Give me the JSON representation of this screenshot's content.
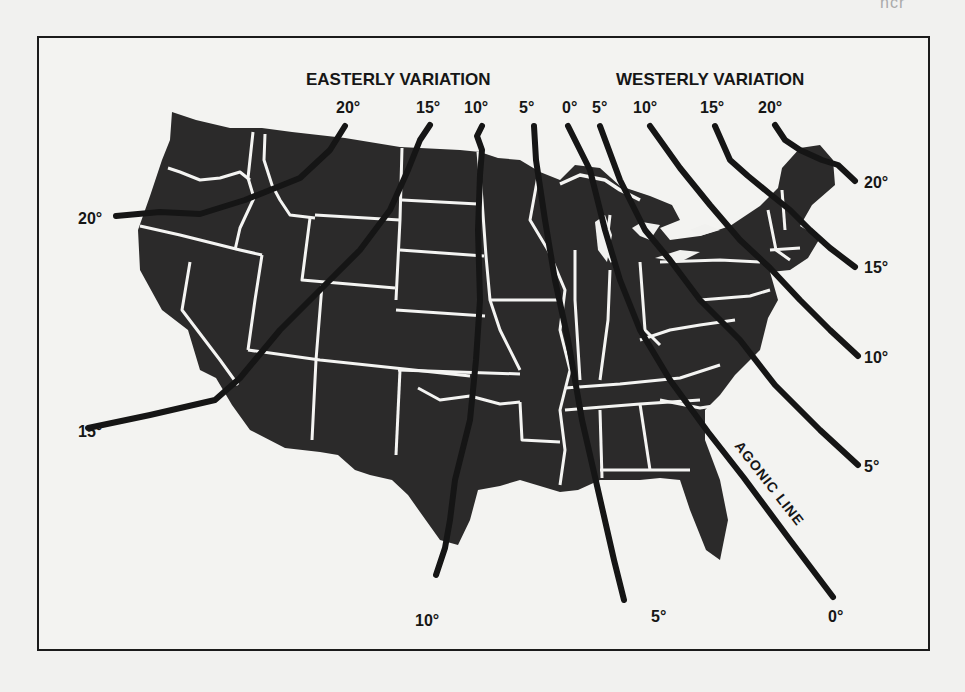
{
  "figure": {
    "title_fragment": "...",
    "ghost_text": "ncr",
    "headings": {
      "easterly": "EASTERLY VARIATION",
      "westerly": "WESTERLY VARIATION"
    },
    "agonic_label": "AGONIC LINE",
    "colors": {
      "land": "#2b2a2a",
      "borders": "#f4f4f2",
      "isogonic_lines": "#151515",
      "frame": "#1b1b1b",
      "paper": "#f1f1ef"
    },
    "top_labels": [
      {
        "text": "20°",
        "side": "easterly"
      },
      {
        "text": "15°",
        "side": "easterly"
      },
      {
        "text": "10°",
        "side": "easterly"
      },
      {
        "text": "5°",
        "side": "easterly"
      },
      {
        "text": "0°",
        "side": "agonic"
      },
      {
        "text": "5°",
        "side": "westerly"
      },
      {
        "text": "10°",
        "side": "westerly"
      },
      {
        "text": "15°",
        "side": "westerly"
      },
      {
        "text": "20°",
        "side": "westerly"
      }
    ],
    "left_labels": [
      {
        "text": "20°"
      },
      {
        "text": "15°"
      }
    ],
    "right_labels": [
      {
        "text": "20°"
      },
      {
        "text": "15°"
      },
      {
        "text": "10°"
      },
      {
        "text": "5°"
      }
    ],
    "bottom_labels": [
      {
        "text": "10°"
      },
      {
        "text": "5°"
      },
      {
        "text": "0°"
      }
    ]
  }
}
